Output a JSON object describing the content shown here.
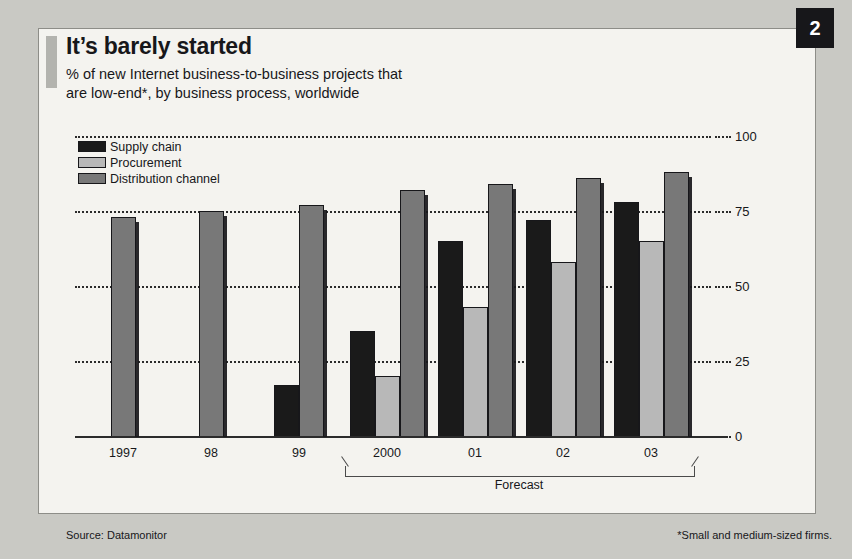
{
  "badge": {
    "number": "2"
  },
  "header": {
    "title": "It’s barely started",
    "subtitle": "% of new Internet business-to-business projects that\nare low-end*, by business process, worldwide"
  },
  "footer": {
    "source": "Source: Datamonitor",
    "footnote": "*Small and medium-sized firms."
  },
  "colors": {
    "supply_chain": "#1a1a1a",
    "procurement": "#b8b8b8",
    "distribution_channel": "#787878",
    "outline": "#17171a",
    "grid": "#2b2b2b",
    "page_background": "#c9c9c4",
    "card_background": "#f4f3ef",
    "accent_bar": "#b3b3ae"
  },
  "chart_data": {
    "type": "bar",
    "title": "It’s barely started",
    "subtitle": "% of new Internet business-to-business projects that are low-end*, by business process, worldwide",
    "xlabel": "",
    "ylabel": "",
    "ylim": [
      0,
      100
    ],
    "yticks": [
      0,
      25,
      50,
      75,
      100
    ],
    "grid": true,
    "legend_position": "top-left",
    "categories": [
      "1997",
      "98",
      "99",
      "2000",
      "01",
      "02",
      "03"
    ],
    "series": [
      {
        "name": "Supply chain",
        "color": "#1a1a1a",
        "values": [
          null,
          null,
          17,
          35,
          65,
          72,
          78
        ]
      },
      {
        "name": "Procurement",
        "color": "#b8b8b8",
        "values": [
          null,
          null,
          null,
          20,
          43,
          58,
          65
        ]
      },
      {
        "name": "Distribution channel",
        "color": "#787878",
        "values": [
          73,
          75,
          77,
          82,
          84,
          86,
          88
        ]
      }
    ],
    "annotations": [
      {
        "text": "Forecast",
        "spans": [
          "2000",
          "03"
        ]
      }
    ]
  }
}
